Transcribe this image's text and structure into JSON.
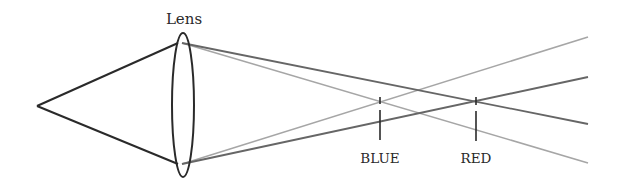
{
  "diagram": {
    "title_label": "Lens",
    "focus_labels": {
      "blue": "BLUE",
      "red": "RED"
    },
    "colors": {
      "background": "#ffffff",
      "incoming_rays": "#2a2a2a",
      "lens_outline": "#2a2a2a",
      "red_rays": "#666666",
      "blue_rays": "#a6a6a6",
      "markers": "#2a2a2a"
    }
  }
}
